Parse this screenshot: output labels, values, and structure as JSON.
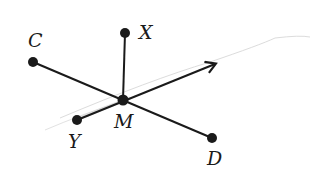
{
  "diagram": {
    "type": "geometry-lines-through-point",
    "center": {
      "label": "M",
      "x": 123,
      "y": 100
    },
    "points": [
      {
        "id": "C",
        "label": "C",
        "x": 33,
        "y": 62,
        "label_x": 28,
        "label_y": 47
      },
      {
        "id": "X",
        "label": "X",
        "x": 125,
        "y": 33,
        "label_x": 139,
        "label_y": 39
      },
      {
        "id": "D",
        "label": "D",
        "x": 212,
        "y": 138,
        "label_x": 207,
        "label_y": 165
      },
      {
        "id": "Y",
        "label": "Y",
        "x": 77,
        "y": 120,
        "label_x": 68,
        "label_y": 148
      }
    ],
    "center_label": {
      "text": "M",
      "x": 114,
      "y": 128
    },
    "ray": {
      "from": "M",
      "to_x": 216,
      "to_y": 64,
      "description": "ray from M through Y direction with arrowhead"
    },
    "colors": {
      "stroke": "#1a1a1a",
      "faint": "#d8d8d8"
    }
  }
}
